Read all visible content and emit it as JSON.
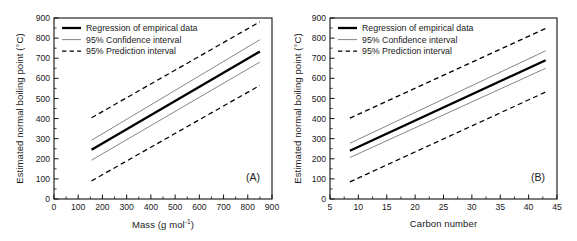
{
  "figure": {
    "panels": [
      {
        "tag": "(A)",
        "ylabel_main": "Estimated normal boiling point (",
        "ylabel_unit": "°C",
        "ylabel_close": ")",
        "xlabel_main": "Mass (g mol",
        "xlabel_sup": "-1",
        "xlabel_close": ")"
      },
      {
        "tag": "(B)",
        "ylabel_main": "Estimated normal boiling point (",
        "ylabel_unit": "°C",
        "ylabel_close": ")",
        "xlabel_main": "Carbon number",
        "xlabel_sup": "",
        "xlabel_close": ""
      }
    ],
    "legend": {
      "items": [
        {
          "label": "Regression of empirical data",
          "style": "solid-thick",
          "color": "#000000"
        },
        {
          "label": "95% Confidence interval",
          "style": "solid-thin",
          "color": "#777777"
        },
        {
          "label": "95% Prediction interval",
          "style": "dashed",
          "color": "#000000"
        }
      ]
    }
  },
  "chart_data": [
    {
      "type": "line",
      "title": "(A)",
      "xlabel": "Mass (g mol-1)",
      "ylabel": "Estimated normal boiling point (°C)",
      "xlim": [
        0,
        900
      ],
      "ylim": [
        0,
        900
      ],
      "xticks": [
        0,
        100,
        200,
        300,
        400,
        500,
        600,
        700,
        800,
        900
      ],
      "yticks": [
        0,
        100,
        200,
        300,
        400,
        500,
        600,
        700,
        800,
        900
      ],
      "grid": false,
      "legend_position": "top-left",
      "x_range_of_data": [
        155,
        850
      ],
      "series": [
        {
          "name": "Regression of empirical data",
          "style": "solid-thick",
          "color": "#000000",
          "x": [
            155,
            850
          ],
          "values": [
            245,
            733
          ]
        },
        {
          "name": "95% Confidence interval (upper)",
          "style": "solid-thin",
          "color": "#777777",
          "x": [
            155,
            850
          ],
          "values": [
            292,
            792
          ]
        },
        {
          "name": "95% Confidence interval (lower)",
          "style": "solid-thin",
          "color": "#777777",
          "x": [
            155,
            850
          ],
          "values": [
            193,
            681
          ]
        },
        {
          "name": "95% Prediction interval (upper)",
          "style": "dashed",
          "color": "#000000",
          "x": [
            155,
            850
          ],
          "values": [
            404,
            881
          ]
        },
        {
          "name": "95% Prediction interval (lower)",
          "style": "dashed",
          "color": "#000000",
          "x": [
            155,
            850
          ],
          "values": [
            90,
            565
          ]
        }
      ]
    },
    {
      "type": "line",
      "title": "(B)",
      "xlabel": "Carbon number",
      "ylabel": "Estimated normal boiling point (°C)",
      "xlim": [
        5,
        45
      ],
      "ylim": [
        0,
        900
      ],
      "xticks": [
        5,
        10,
        15,
        20,
        25,
        30,
        35,
        40,
        45
      ],
      "yticks": [
        0,
        100,
        200,
        300,
        400,
        500,
        600,
        700,
        800,
        900
      ],
      "grid": false,
      "legend_position": "top-left",
      "x_range_of_data": [
        8.5,
        43
      ],
      "series": [
        {
          "name": "Regression of empirical data",
          "style": "solid-thick",
          "color": "#000000",
          "x": [
            8.5,
            43
          ],
          "values": [
            240,
            690
          ]
        },
        {
          "name": "95% Confidence interval (upper)",
          "style": "solid-thin",
          "color": "#777777",
          "x": [
            8.5,
            43
          ],
          "values": [
            277,
            737
          ]
        },
        {
          "name": "95% Confidence interval (lower)",
          "style": "solid-thin",
          "color": "#777777",
          "x": [
            8.5,
            43
          ],
          "values": [
            206,
            650
          ]
        },
        {
          "name": "95% Prediction interval (upper)",
          "style": "dashed",
          "color": "#000000",
          "x": [
            8.5,
            43
          ],
          "values": [
            402,
            848
          ]
        },
        {
          "name": "95% Prediction interval (lower)",
          "style": "dashed",
          "color": "#000000",
          "x": [
            8.5,
            43
          ],
          "values": [
            85,
            532
          ]
        }
      ]
    }
  ]
}
